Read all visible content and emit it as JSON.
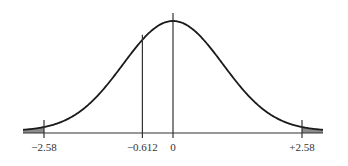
{
  "chart_data": {
    "type": "line",
    "title": "",
    "xlabel": "",
    "ylabel": "",
    "distribution": {
      "name": "standard normal",
      "mean": 0,
      "sd": 1
    },
    "xlim": [
      -3.0,
      3.0
    ],
    "grid": false,
    "legend": null,
    "markers": [
      {
        "x": -2.58,
        "label": "−2.58"
      },
      {
        "x": -0.612,
        "label": "−0.612"
      },
      {
        "x": 0,
        "label": "0"
      },
      {
        "x": 2.58,
        "label": "+2.58"
      }
    ],
    "shaded_regions": [
      {
        "from": -3.0,
        "to": -2.58,
        "side": "left tail"
      },
      {
        "from": 2.58,
        "to": 3.0,
        "side": "right tail"
      }
    ]
  },
  "colors": {
    "curve": "#1a1a1a",
    "axis": "#333333",
    "shade": "#8c8c8c",
    "label": "#333333"
  },
  "layout": {
    "baseline_y": 133,
    "center_x": 173,
    "sigma_px": 50,
    "peak_y": 21
  }
}
